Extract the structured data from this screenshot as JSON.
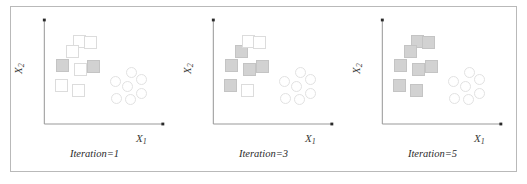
{
  "figure": {
    "type": "scatter-series",
    "border_color": "#b9b9b9",
    "background": "#ffffff",
    "axis_color": "#9a9a9a",
    "panel_count": 3
  },
  "chart_data": {
    "type": "scatter",
    "title": "",
    "subtitle": "",
    "xlabel": "X1",
    "ylabel": "X2",
    "xlim": [
      0,
      100
    ],
    "ylim": [
      0,
      100
    ],
    "grid": false,
    "legend_position": "none",
    "axis_style": "arrow-axes",
    "annotations": [
      "Iteration=1",
      "Iteration=3",
      "Iteration=5"
    ],
    "panels": [
      {
        "caption": "Iteration=1",
        "xlabel": "X1",
        "ylabel": "X2",
        "series": [
          {
            "name": "cluster-squares-filled",
            "marker": "square",
            "fill": "#d2d2d2",
            "stroke": "#c4c4c4",
            "points": [
              {
                "x": 14,
                "y": 59
              },
              {
                "x": 43,
                "y": 58
              }
            ]
          },
          {
            "name": "cluster-squares-open",
            "marker": "square",
            "fill": "#ffffff",
            "stroke": "#dcdcdc",
            "points": [
              {
                "x": 30,
                "y": 83
              },
              {
                "x": 40,
                "y": 82
              },
              {
                "x": 23,
                "y": 73
              },
              {
                "x": 31,
                "y": 55
              },
              {
                "x": 13,
                "y": 39
              },
              {
                "x": 29,
                "y": 34
              }
            ]
          },
          {
            "name": "cluster-circles-open",
            "marker": "circle",
            "fill": "#ffffff",
            "stroke": "#e2e2e2",
            "points": [
              {
                "x": 79,
                "y": 52
              },
              {
                "x": 64,
                "y": 43
              },
              {
                "x": 75,
                "y": 38
              },
              {
                "x": 88,
                "y": 45
              },
              {
                "x": 65,
                "y": 26
              },
              {
                "x": 78,
                "y": 25
              },
              {
                "x": 88,
                "y": 31
              }
            ]
          }
        ]
      },
      {
        "caption": "Iteration=3",
        "xlabel": "X1",
        "ylabel": "X2",
        "series": [
          {
            "name": "cluster-squares-filled",
            "marker": "square",
            "fill": "#d2d2d2",
            "stroke": "#c4c4c4",
            "points": [
              {
                "x": 23,
                "y": 73
              },
              {
                "x": 14,
                "y": 59
              },
              {
                "x": 43,
                "y": 58
              },
              {
                "x": 31,
                "y": 55
              },
              {
                "x": 13,
                "y": 39
              }
            ]
          },
          {
            "name": "cluster-squares-open",
            "marker": "square",
            "fill": "#ffffff",
            "stroke": "#dcdcdc",
            "points": [
              {
                "x": 30,
                "y": 83
              },
              {
                "x": 40,
                "y": 82
              },
              {
                "x": 29,
                "y": 34
              }
            ]
          },
          {
            "name": "cluster-circles-open",
            "marker": "circle",
            "fill": "#ffffff",
            "stroke": "#e2e2e2",
            "points": [
              {
                "x": 79,
                "y": 52
              },
              {
                "x": 64,
                "y": 43
              },
              {
                "x": 75,
                "y": 38
              },
              {
                "x": 88,
                "y": 45
              },
              {
                "x": 65,
                "y": 26
              },
              {
                "x": 78,
                "y": 25
              },
              {
                "x": 88,
                "y": 31
              }
            ]
          }
        ]
      },
      {
        "caption": "Iteration=5",
        "xlabel": "X1",
        "ylabel": "X2",
        "series": [
          {
            "name": "cluster-squares-filled",
            "marker": "square",
            "fill": "#d2d2d2",
            "stroke": "#c4c4c4",
            "points": [
              {
                "x": 30,
                "y": 83
              },
              {
                "x": 40,
                "y": 82
              },
              {
                "x": 23,
                "y": 73
              },
              {
                "x": 14,
                "y": 59
              },
              {
                "x": 43,
                "y": 58
              },
              {
                "x": 31,
                "y": 55
              },
              {
                "x": 13,
                "y": 39
              },
              {
                "x": 29,
                "y": 34
              }
            ]
          },
          {
            "name": "cluster-squares-open",
            "marker": "square",
            "fill": "#ffffff",
            "stroke": "#dcdcdc",
            "points": []
          },
          {
            "name": "cluster-circles-open",
            "marker": "circle",
            "fill": "#ffffff",
            "stroke": "#e2e2e2",
            "points": [
              {
                "x": 79,
                "y": 52
              },
              {
                "x": 64,
                "y": 43
              },
              {
                "x": 75,
                "y": 38
              },
              {
                "x": 88,
                "y": 45
              },
              {
                "x": 65,
                "y": 26
              },
              {
                "x": 78,
                "y": 25
              },
              {
                "x": 88,
                "y": 31
              }
            ]
          }
        ]
      }
    ]
  }
}
